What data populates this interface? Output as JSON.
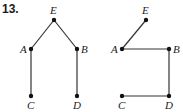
{
  "problem_number": "13.",
  "graphs": [
    {
      "nodes": [
        {
          "id": "E",
          "x": 54,
          "y": 20,
          "lx": 50,
          "ly": 14
        },
        {
          "id": "A",
          "x": 31,
          "y": 49,
          "lx": 20,
          "ly": 53
        },
        {
          "id": "B",
          "x": 77,
          "y": 49,
          "lx": 81,
          "ly": 53
        },
        {
          "id": "C",
          "x": 31,
          "y": 96,
          "lx": 27,
          "ly": 109
        },
        {
          "id": "D",
          "x": 77,
          "y": 96,
          "lx": 73,
          "ly": 109
        }
      ],
      "edges": [
        [
          "E",
          "A"
        ],
        [
          "E",
          "B"
        ],
        [
          "A",
          "C"
        ],
        [
          "B",
          "D"
        ]
      ]
    },
    {
      "nodes": [
        {
          "id": "E",
          "x": 146,
          "y": 20,
          "lx": 142,
          "ly": 14
        },
        {
          "id": "A",
          "x": 122,
          "y": 49,
          "lx": 111,
          "ly": 53
        },
        {
          "id": "B",
          "x": 169,
          "y": 49,
          "lx": 173,
          "ly": 53
        },
        {
          "id": "C",
          "x": 122,
          "y": 96,
          "lx": 118,
          "ly": 109
        },
        {
          "id": "D",
          "x": 169,
          "y": 96,
          "lx": 165,
          "ly": 109
        }
      ],
      "edges": [
        [
          "E",
          "A"
        ],
        [
          "A",
          "B"
        ],
        [
          "B",
          "D"
        ],
        [
          "C",
          "D"
        ]
      ]
    }
  ]
}
